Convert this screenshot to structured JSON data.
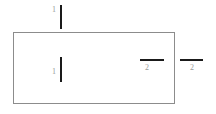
{
  "diagram": {
    "background_color": "#ffffff",
    "shape": {
      "name": "rectangle",
      "stroke_color": "#8c8c8c",
      "fill_color": "#ffffff",
      "stroke_width": 1,
      "x": 13,
      "y": 32,
      "width": 162,
      "height": 72
    },
    "marks": [
      {
        "id": "top-vertical",
        "orientation": "vertical",
        "label": "1",
        "color": "#1a1a1a",
        "label_color": "#9a9a9a",
        "position": "above-rectangle",
        "x": 60,
        "y": 5,
        "length": 24
      },
      {
        "id": "inner-vertical",
        "orientation": "vertical",
        "label": "1",
        "color": "#1a1a1a",
        "label_color": "#9a9a9a",
        "position": "inside-rectangle-left",
        "x": 60,
        "y": 57,
        "length": 25
      },
      {
        "id": "inner-horizontal",
        "orientation": "horizontal",
        "label": "2",
        "color": "#1a1a1a",
        "label_color": "#9a9a9a",
        "position": "inside-rectangle-right",
        "x": 140,
        "y": 59,
        "length": 24
      },
      {
        "id": "outer-horizontal",
        "orientation": "horizontal",
        "label": "2",
        "color": "#1a1a1a",
        "label_color": "#9a9a9a",
        "position": "right-of-rectangle",
        "x": 180,
        "y": 59,
        "length": 23
      }
    ]
  }
}
